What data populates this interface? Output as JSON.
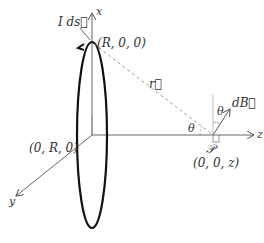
{
  "diagram": {
    "type": "physics-3d-axes",
    "axes": {
      "x": "x",
      "y": "y",
      "z": "z"
    },
    "labels": {
      "current_element": "I ds⃗",
      "top_point": "(R, 0, 0)",
      "side_point": "(0, R, 0)",
      "r_vector": "r⃗",
      "theta_at_P": "θ",
      "theta_at_dB": "θ",
      "dB_vector": "dB⃗",
      "point_name": "𝒫",
      "point_coords": "(0, 0, z)"
    },
    "colors": {
      "axis": "#666666",
      "loop": "#111111",
      "dashed": "#999999"
    }
  }
}
